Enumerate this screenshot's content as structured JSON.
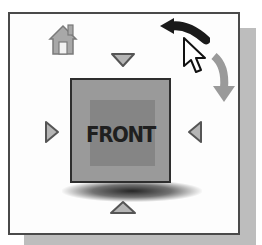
{
  "viewcube": {
    "face_label": "FRONT",
    "icons": {
      "home": "home-icon",
      "rotate_ccw": "curved-arrow-left-icon",
      "rotate_cw": "curved-arrow-down-icon",
      "cursor": "mouse-pointer-icon",
      "arrow_top": "triangle-down-icon",
      "arrow_bottom": "triangle-up-icon",
      "arrow_left": "triangle-right-icon",
      "arrow_right": "triangle-left-icon"
    },
    "colors": {
      "panel_border": "#4a4a4a",
      "panel_bg": "#fdfdfd",
      "shadow": "#bdbdbd",
      "cube_face": "#9a9a9a",
      "cube_inner": "#858585",
      "label": "#1f1f1f",
      "arrow_fill": "#b5b5b5",
      "arrow_stroke": "#555555",
      "rotate_dark": "#1a1a1a"
    }
  }
}
